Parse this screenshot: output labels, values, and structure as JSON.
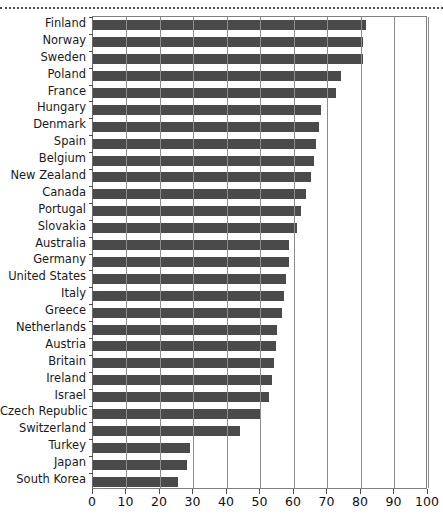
{
  "page": {
    "top_rule": "dotted-rule",
    "background_color": "#ffffff"
  },
  "chart_data": {
    "type": "bar",
    "orientation": "horizontal",
    "title": "",
    "subtitle": "",
    "xlabel": "",
    "ylabel": "",
    "xlim": [
      0,
      100
    ],
    "xticks": [
      0,
      10,
      20,
      30,
      40,
      50,
      60,
      70,
      80,
      90,
      100
    ],
    "xtick_labels": [
      "0",
      "10",
      "20",
      "30",
      "40",
      "50",
      "60",
      "70",
      "80",
      "90",
      "100"
    ],
    "grid": true,
    "grid_axis": "x",
    "legend": null,
    "bar_color": "#4a4a4a",
    "gridline_color": "#8c8c8c",
    "axis_color": "#4d4d4d",
    "categories": [
      "Finland",
      "Norway",
      "Sweden",
      "Poland",
      "France",
      "Hungary",
      "Denmark",
      "Spain",
      "Belgium",
      "New Zealand",
      "Canada",
      "Portugal",
      "Slovakia",
      "Australia",
      "Germany",
      "United States",
      "Italy",
      "Greece",
      "Netherlands",
      "Austria",
      "Britain",
      "Ireland",
      "Israel",
      "Czech Republic",
      "Switzerland",
      "Turkey",
      "Japan",
      "South Korea"
    ],
    "values": [
      81.5,
      80.5,
      80.5,
      74,
      72.5,
      68,
      67.5,
      66.5,
      66,
      65,
      63.5,
      62,
      61,
      58.5,
      58.5,
      57.5,
      57,
      56.5,
      55,
      54.5,
      54,
      53.5,
      52.5,
      50,
      44,
      29,
      28,
      25.5
    ]
  }
}
